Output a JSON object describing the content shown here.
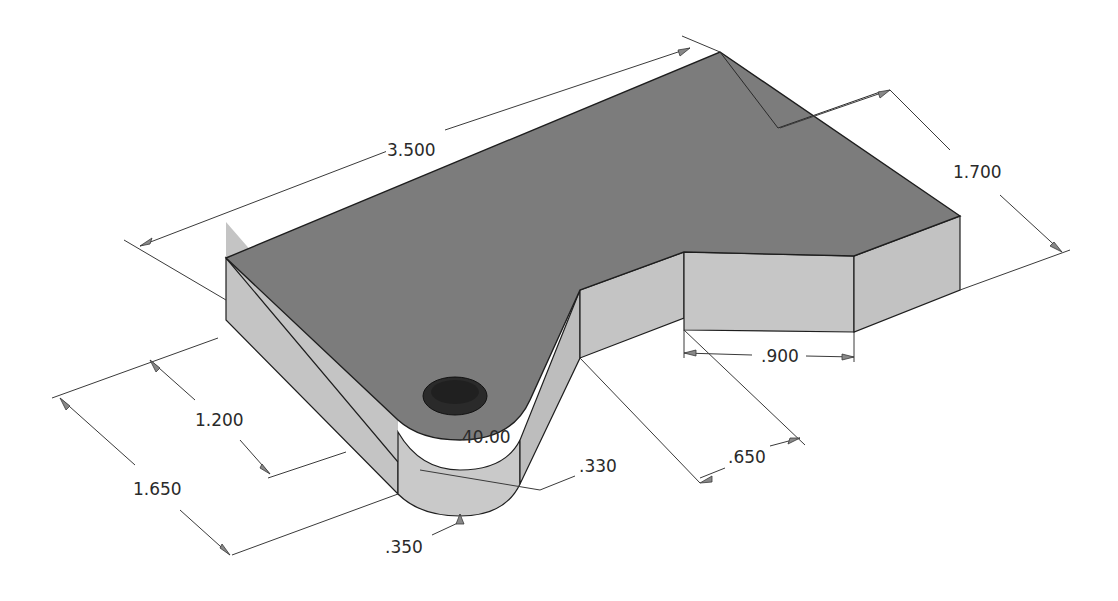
{
  "drawing": {
    "type": "isometric part drawing",
    "colors": {
      "background": "#ffffff",
      "top_face": "#7c7c7c",
      "side_face": "#c4c4c4",
      "side_face_dark": "#b3b3b3",
      "edge": "#1e1e1e",
      "dim_line": "#3a3a3a",
      "hole": "#2a2a2a"
    }
  },
  "dimensions": {
    "overall_length": ".3500",
    "overall_length_value": "3.500",
    "right_width": "1.700",
    "left_width": "1.650",
    "tab_offset": "1.200",
    "notch_length": ".900",
    "notch_depth": ".650",
    "angle": "40.00",
    "hole_offset": ".330",
    "tab_radius": ".350"
  }
}
